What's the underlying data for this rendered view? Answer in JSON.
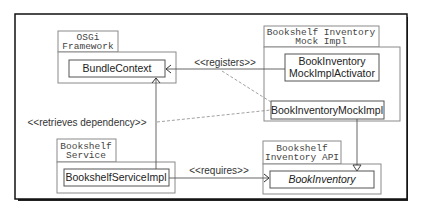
{
  "diagram": {
    "type": "uml-package-dependency",
    "colors": {
      "frame": "#111111",
      "package_border": "#8a8a8a",
      "class_border": "#555555",
      "line": "#555555",
      "dashed": "#777777",
      "text": "#222222"
    },
    "packages": [
      {
        "id": "osgi",
        "tab_lines": [
          "OSGi",
          "Framework"
        ],
        "classes": [
          "BundleContext"
        ]
      },
      {
        "id": "mock",
        "tab_lines": [
          "Bookshelf Inventory",
          "Mock Impl"
        ],
        "classes": [
          "BookInventory",
          "MockImplActivator",
          "BookInventoryMockImpl"
        ]
      },
      {
        "id": "service",
        "tab_lines": [
          "Bookshelf",
          "Service"
        ],
        "classes": [
          "BookshelfServiceImpl"
        ]
      },
      {
        "id": "api",
        "tab_lines": [
          "Bookshelf",
          "Inventory API"
        ],
        "classes": [
          "BookInventory"
        ]
      }
    ],
    "class_labels": {
      "bundle_context": "BundleContext",
      "activator_line1": "BookInventory",
      "activator_line2": "MockImplActivator",
      "mock_impl": "BookInventoryMockImpl",
      "service_impl": "BookshelfServiceImpl",
      "book_inventory": "BookInventory"
    },
    "tab_labels": {
      "osgi_1": "OSGi",
      "osgi_2": "Framework",
      "mock_1": "Bookshelf Inventory",
      "mock_2": "Mock Impl",
      "service_1": "Bookshelf",
      "service_2": "Service",
      "api_1": "Bookshelf",
      "api_2": "Inventory API"
    },
    "relations": {
      "registers": "<<registers>>",
      "retrieves": "<<retrieves dependency>>",
      "requires": "<<requires>>"
    },
    "edges": [
      {
        "from": "BookInventoryMockImplActivator",
        "to": "BundleContext",
        "label": "<<registers>>",
        "style": "solid",
        "arrow": "open"
      },
      {
        "from": "<<registers>>",
        "to": "BookInventoryMockImpl",
        "style": "dashed"
      },
      {
        "from": "BookshelfServiceImpl",
        "to": "BundleContext",
        "style": "solid",
        "arrow": "open"
      },
      {
        "from": "<<retrieves dependency>>",
        "to": "BookInventoryMockImpl",
        "style": "dashed"
      },
      {
        "from": "BookshelfServiceImpl",
        "to": "BookInventory",
        "label": "<<requires>>",
        "style": "solid",
        "arrow": "open"
      },
      {
        "from": "BookInventoryMockImpl",
        "to": "BookInventory",
        "style": "solid",
        "arrow": "hollow-triangle"
      }
    ]
  }
}
